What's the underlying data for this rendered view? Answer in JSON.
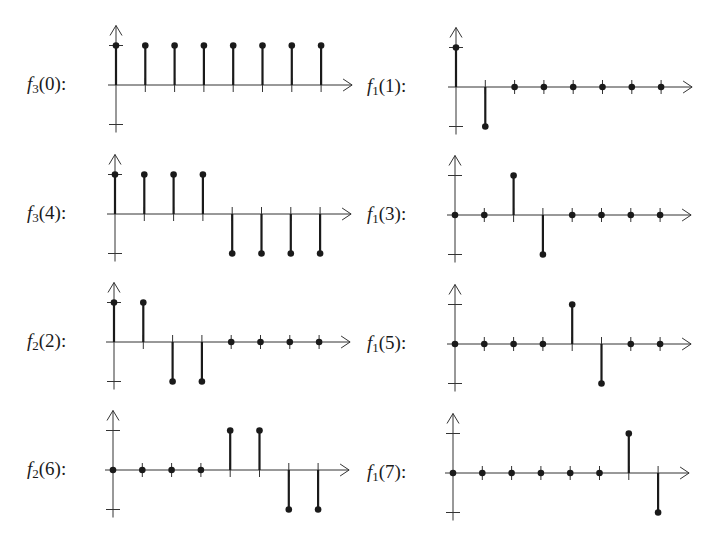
{
  "chart_data": {
    "type": "stem",
    "title": "",
    "xlabel": "",
    "ylabel": "",
    "ylim": [
      -1,
      1
    ],
    "x": [
      0,
      1,
      2,
      3,
      4,
      5,
      6,
      7
    ],
    "grid": false,
    "layout": "4 rows x 2 columns of stem plots",
    "panels": [
      {
        "id": "f3_0",
        "label": {
          "fn": "f",
          "sub": "3",
          "arg": "(0):"
        },
        "values": [
          1,
          1,
          1,
          1,
          1,
          1,
          1,
          1
        ]
      },
      {
        "id": "f1_1",
        "label": {
          "fn": "f",
          "sub": "1",
          "arg": "(1):"
        },
        "values": [
          1,
          -1,
          0,
          0,
          0,
          0,
          0,
          0
        ]
      },
      {
        "id": "f3_4",
        "label": {
          "fn": "f",
          "sub": "3",
          "arg": "(4):"
        },
        "values": [
          1,
          1,
          1,
          1,
          -1,
          -1,
          -1,
          -1
        ]
      },
      {
        "id": "f1_3",
        "label": {
          "fn": "f",
          "sub": "1",
          "arg": "(3):"
        },
        "values": [
          0,
          0,
          1,
          -1,
          0,
          0,
          0,
          0
        ]
      },
      {
        "id": "f2_2",
        "label": {
          "fn": "f",
          "sub": "2",
          "arg": "(2):"
        },
        "values": [
          1,
          1,
          -1,
          -1,
          0,
          0,
          0,
          0
        ]
      },
      {
        "id": "f1_5",
        "label": {
          "fn": "f",
          "sub": "1",
          "arg": "(5):"
        },
        "values": [
          0,
          0,
          0,
          0,
          1,
          -1,
          0,
          0
        ]
      },
      {
        "id": "f2_6",
        "label": {
          "fn": "f",
          "sub": "2",
          "arg": "(6):"
        },
        "values": [
          0,
          0,
          0,
          0,
          1,
          1,
          -1,
          -1
        ]
      },
      {
        "id": "f1_7",
        "label": {
          "fn": "f",
          "sub": "1",
          "arg": "(7):"
        },
        "values": [
          0,
          0,
          0,
          0,
          0,
          0,
          1,
          -1
        ]
      }
    ]
  },
  "layout_geometry": {
    "panels": [
      {
        "label_x": 27,
        "axis_x": 116,
        "base_y": 85
      },
      {
        "label_x": 367,
        "axis_x": 456,
        "base_y": 87
      },
      {
        "label_x": 27,
        "axis_x": 115,
        "base_y": 214
      },
      {
        "label_x": 367,
        "axis_x": 455,
        "base_y": 215
      },
      {
        "label_x": 27,
        "axis_x": 114,
        "base_y": 342
      },
      {
        "label_x": 367,
        "axis_x": 455,
        "base_y": 344
      },
      {
        "label_x": 27,
        "axis_x": 113,
        "base_y": 470
      },
      {
        "label_x": 367,
        "axis_x": 453,
        "base_y": 473
      }
    ],
    "step": 29.3,
    "unit": 39.5,
    "axis_extra": 31,
    "colors": {
      "ink": "#1a1a1a",
      "axis": "#333333"
    }
  }
}
